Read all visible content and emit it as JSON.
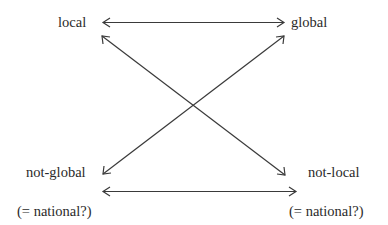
{
  "diagram": {
    "type": "relationship-square",
    "nodes": {
      "top_left": "local",
      "top_right": "global",
      "bottom_left": "not-global",
      "bottom_right": "not-local",
      "bottom_left_note": "(= national?)",
      "bottom_right_note": "(= national?)"
    },
    "edges": [
      {
        "from": "local",
        "to": "global",
        "style": "double-arrow"
      },
      {
        "from": "local",
        "to": "not-local",
        "style": "double-arrow"
      },
      {
        "from": "global",
        "to": "not-global",
        "style": "double-arrow"
      },
      {
        "from": "not-global",
        "to": "not-local",
        "style": "double-arrow"
      }
    ],
    "colors": {
      "line": "#3a3a3a",
      "text": "#2a2a2a",
      "background": "#ffffff"
    }
  }
}
